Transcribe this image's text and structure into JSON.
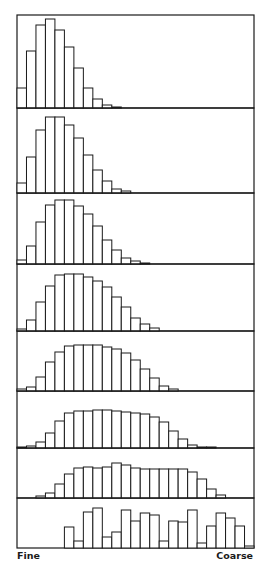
{
  "chart_data": {
    "type": "bar",
    "title": "",
    "xlabel_left": "Fine",
    "xlabel_right": "Coarse",
    "ylabel": "",
    "bins": 25,
    "grid": false,
    "legend": null,
    "colors": {
      "stroke": "#1a1a1a",
      "fill": "#ffffff"
    },
    "panels": [
      {
        "name": "panel-1",
        "y_top": 15,
        "y_bottom": 108,
        "values": [
          20,
          57,
          83,
          89,
          78,
          61,
          40,
          20,
          9,
          3,
          1,
          0,
          0,
          0,
          0,
          0,
          0,
          0,
          0,
          0,
          0,
          0,
          0,
          0,
          0
        ]
      },
      {
        "name": "panel-2",
        "y_top": 108,
        "y_bottom": 193,
        "values": [
          10,
          36,
          63,
          76,
          76,
          68,
          55,
          38,
          23,
          12,
          4,
          2,
          0,
          0,
          0,
          0,
          0,
          0,
          0,
          0,
          0,
          0,
          0,
          0,
          0
        ]
      },
      {
        "name": "panel-3",
        "y_top": 193,
        "y_bottom": 264,
        "values": [
          4,
          18,
          42,
          59,
          64,
          64,
          58,
          50,
          38,
          24,
          14,
          6,
          3,
          1,
          0,
          0,
          0,
          0,
          0,
          0,
          0,
          0,
          0,
          0,
          0
        ]
      },
      {
        "name": "panel-4",
        "y_top": 264,
        "y_bottom": 331,
        "values": [
          2,
          11,
          29,
          45,
          56,
          57,
          57,
          54,
          50,
          44,
          34,
          24,
          13,
          7,
          3,
          0,
          0,
          0,
          0,
          0,
          0,
          0,
          0,
          0,
          0
        ]
      },
      {
        "name": "panel-5",
        "y_top": 331,
        "y_bottom": 391,
        "values": [
          2,
          4,
          14,
          29,
          39,
          45,
          46,
          46,
          46,
          44,
          42,
          38,
          31,
          22,
          13,
          5,
          2,
          0,
          0,
          0,
          0,
          0,
          0,
          0,
          0
        ]
      },
      {
        "name": "panel-6",
        "y_top": 391,
        "y_bottom": 448,
        "values": [
          1,
          2,
          6,
          15,
          27,
          35,
          37,
          37,
          38,
          38,
          37,
          36,
          35,
          34,
          31,
          26,
          17,
          9,
          3,
          1,
          1,
          0,
          0,
          0,
          0
        ]
      },
      {
        "name": "panel-7",
        "y_top": 448,
        "y_bottom": 498,
        "values": [
          0,
          0,
          2,
          5,
          14,
          24,
          30,
          31,
          30,
          31,
          35,
          33,
          30,
          29,
          29,
          29,
          29,
          29,
          26,
          19,
          9,
          3,
          0,
          0,
          0
        ]
      },
      {
        "name": "panel-8",
        "y_top": 498,
        "y_bottom": 548,
        "values": [
          0,
          0,
          0,
          0,
          0,
          21,
          7,
          36,
          40,
          11,
          16,
          38,
          27,
          35,
          33,
          7,
          27,
          26,
          38,
          5,
          22,
          35,
          30,
          22,
          2
        ]
      }
    ],
    "plot_area": {
      "x_left": 17,
      "x_right": 254
    }
  }
}
